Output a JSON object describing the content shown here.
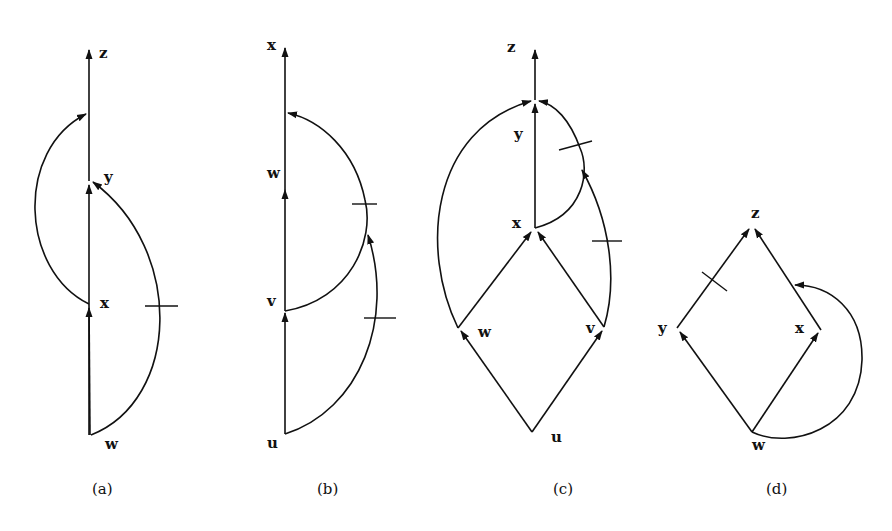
{
  "figure": {
    "panels": [
      {
        "caption": "(a)",
        "nodes": [
          {
            "id": "z",
            "label": "z"
          },
          {
            "id": "y",
            "label": "y"
          },
          {
            "id": "x",
            "label": "x"
          },
          {
            "id": "w",
            "label": "w"
          }
        ],
        "edges": [
          {
            "from": "w",
            "to": "x",
            "type": "straight"
          },
          {
            "from": "x",
            "to": "y",
            "type": "straight"
          },
          {
            "from": "y",
            "to": "z",
            "type": "straight"
          },
          {
            "from": "x",
            "to": "z-line",
            "type": "arc-left"
          },
          {
            "from": "w",
            "to": "y",
            "type": "arc-right",
            "marked": true
          }
        ]
      },
      {
        "caption": "(b)",
        "nodes": [
          {
            "id": "x",
            "label": "x"
          },
          {
            "id": "w",
            "label": "w"
          },
          {
            "id": "v",
            "label": "v"
          },
          {
            "id": "u",
            "label": "u"
          }
        ],
        "edges": [
          {
            "from": "u",
            "to": "v",
            "type": "straight"
          },
          {
            "from": "v",
            "to": "w",
            "type": "straight"
          },
          {
            "from": "w",
            "to": "x",
            "type": "straight"
          },
          {
            "from": "v",
            "to": "x-line",
            "type": "arc-right",
            "marked": true
          },
          {
            "from": "u",
            "to": "arc",
            "type": "arc-right",
            "marked": true
          }
        ]
      },
      {
        "caption": "(c)",
        "nodes": [
          {
            "id": "z",
            "label": "z"
          },
          {
            "id": "y",
            "label": "y"
          },
          {
            "id": "x",
            "label": "x"
          },
          {
            "id": "w",
            "label": "w"
          },
          {
            "id": "v",
            "label": "v"
          },
          {
            "id": "u",
            "label": "u"
          }
        ],
        "edges": [
          {
            "from": "u",
            "to": "w",
            "type": "straight"
          },
          {
            "from": "u",
            "to": "v",
            "type": "straight"
          },
          {
            "from": "w",
            "to": "x",
            "type": "straight"
          },
          {
            "from": "v",
            "to": "x",
            "type": "straight"
          },
          {
            "from": "x",
            "to": "y",
            "type": "straight"
          },
          {
            "from": "y",
            "to": "z",
            "type": "straight"
          },
          {
            "from": "w",
            "to": "y-top",
            "type": "arc-left"
          },
          {
            "from": "x",
            "to": "y-top",
            "type": "arc-right",
            "marked": true
          },
          {
            "from": "v",
            "to": "arc",
            "type": "arc-right",
            "marked": true
          }
        ]
      },
      {
        "caption": "(d)",
        "nodes": [
          {
            "id": "z",
            "label": "z"
          },
          {
            "id": "y",
            "label": "y"
          },
          {
            "id": "x",
            "label": "x"
          },
          {
            "id": "w",
            "label": "w"
          }
        ],
        "edges": [
          {
            "from": "w",
            "to": "y",
            "type": "straight"
          },
          {
            "from": "w",
            "to": "x",
            "type": "straight"
          },
          {
            "from": "y",
            "to": "z",
            "type": "straight",
            "marked": true
          },
          {
            "from": "x",
            "to": "z",
            "type": "straight"
          },
          {
            "from": "w",
            "to": "xz-edge",
            "type": "arc-right"
          }
        ]
      }
    ]
  }
}
